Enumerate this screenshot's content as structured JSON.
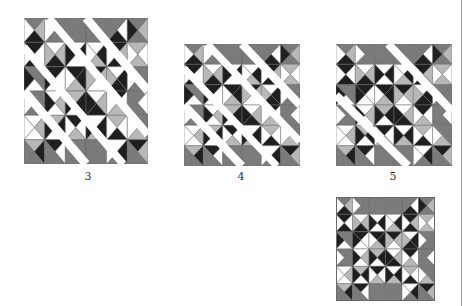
{
  "figure": {
    "colors": {
      "dark": "#1f1f1f",
      "medium": "#7b7b7b",
      "light": "#b8b8b8",
      "white": "#ffffff",
      "stroke": "#6a6a6a"
    },
    "blocks": [
      {
        "id": "step-3",
        "label": "3",
        "x": 24,
        "y": 18,
        "w": 124,
        "h": 146,
        "label_x": 78,
        "label_y": 170,
        "layout": "separated-wide"
      },
      {
        "id": "step-4",
        "label": "4",
        "x": 184,
        "y": 44,
        "w": 116,
        "h": 122,
        "label_x": 231,
        "label_y": 170,
        "layout": "separated-cross"
      },
      {
        "id": "step-5",
        "label": "5",
        "x": 336,
        "y": 44,
        "w": 116,
        "h": 122,
        "label_x": 383,
        "label_y": 170,
        "layout": "separated-diagonal"
      },
      {
        "id": "finished",
        "label": "",
        "x": 336,
        "y": 197,
        "w": 99,
        "h": 104,
        "label_x": 0,
        "label_y": 0,
        "layout": "assembled"
      }
    ]
  }
}
